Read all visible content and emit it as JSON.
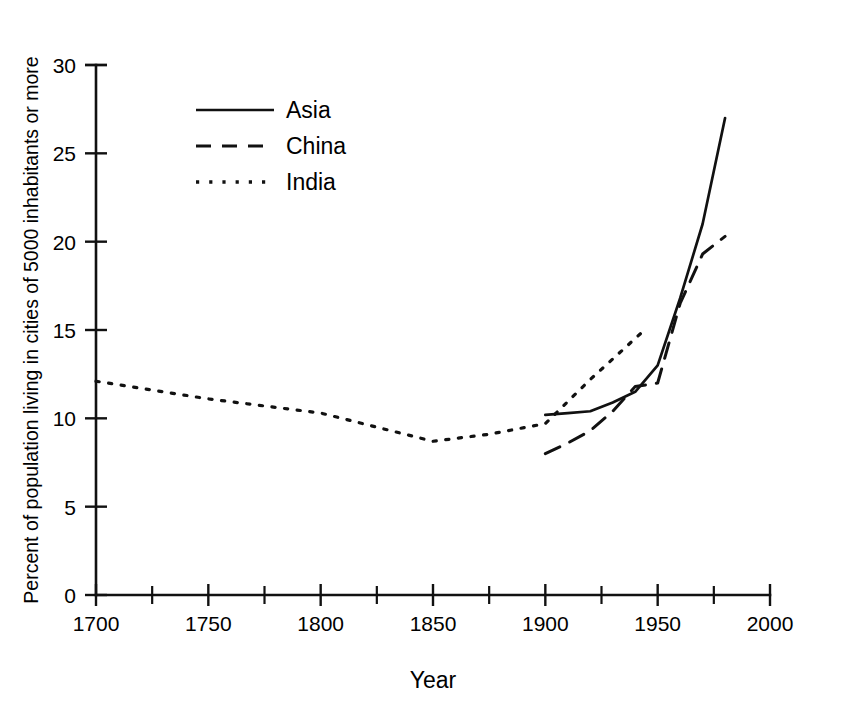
{
  "chart_data": {
    "type": "line",
    "title": "",
    "subtitle": "",
    "xlabel": "Year",
    "ylabel": "Percent of population living in cities of 5000 inhabitants or more",
    "xlim": [
      1700,
      2000
    ],
    "ylim": [
      0,
      30
    ],
    "xticks": [
      1700,
      1750,
      1800,
      1850,
      1900,
      1950,
      2000
    ],
    "xtick_labels": [
      "1700",
      "1750",
      "1800",
      "1850",
      "1900",
      "1950",
      "2000"
    ],
    "xminor_ticks": [
      1725,
      1775,
      1825,
      1875,
      1925,
      1975
    ],
    "yticks": [
      0,
      5,
      10,
      15,
      20,
      25,
      30
    ],
    "ytick_labels": [
      "0",
      "5",
      "10",
      "15",
      "20",
      "25",
      "30"
    ],
    "grid": false,
    "legend_position": "upper-left-inside",
    "series": [
      {
        "name": "Asia",
        "style": "solid",
        "x": [
          1900,
          1910,
          1920,
          1930,
          1940,
          1950,
          1960,
          1970,
          1980
        ],
        "y": [
          10.2,
          10.3,
          10.4,
          10.9,
          11.5,
          13.0,
          16.8,
          21.0,
          27.0
        ]
      },
      {
        "name": "China",
        "style": "dashed",
        "x": [
          1900,
          1910,
          1920,
          1930,
          1940,
          1950,
          1960,
          1970,
          1980
        ],
        "y": [
          8.0,
          8.6,
          9.3,
          10.4,
          11.8,
          12.0,
          16.5,
          19.3,
          20.3
        ]
      },
      {
        "name": "India",
        "style": "dotted",
        "x": [
          1700,
          1725,
          1750,
          1775,
          1800,
          1825,
          1850,
          1875,
          1900,
          1920,
          1945
        ],
        "y": [
          12.1,
          11.6,
          11.1,
          10.7,
          10.3,
          9.5,
          8.7,
          9.1,
          9.7,
          12.2,
          15.1
        ]
      }
    ]
  },
  "legend": {
    "items": [
      {
        "label": "Asia",
        "style": "solid"
      },
      {
        "label": "China",
        "style": "dashed"
      },
      {
        "label": "India",
        "style": "dotted"
      }
    ]
  },
  "colors": {
    "ink": "#111111",
    "background": "#ffffff"
  }
}
